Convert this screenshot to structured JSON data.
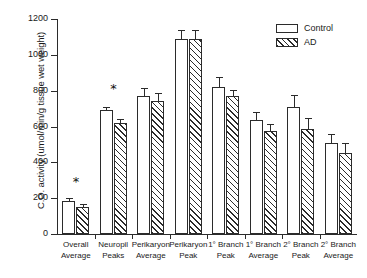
{
  "chart_data": {
    "type": "bar",
    "title": "",
    "xlabel": "",
    "ylabel": "C.O. activity (umol/min/g tissue wet weight)",
    "ylim": [
      0,
      1200
    ],
    "yticks": [
      0,
      200,
      400,
      600,
      800,
      1000,
      1200
    ],
    "grid": false,
    "legend_position": "top-right",
    "categories": [
      "Overall Average",
      "Neuropil Peaks",
      "Perikaryon Average",
      "Perikaryon Peak",
      "1° Branch Peak",
      "1° Branch Average",
      "2° Branch Peak",
      "2° Branch Average"
    ],
    "category_lines": [
      [
        "Overall",
        "Average"
      ],
      [
        "Neuropil",
        "Peaks"
      ],
      [
        "Perikaryon",
        "Average"
      ],
      [
        "Perikaryon",
        "Peak"
      ],
      [
        "1° Branch",
        "Peak"
      ],
      [
        "1° Branch",
        "Average"
      ],
      [
        "2° Branch",
        "Peak"
      ],
      [
        "2° Branch",
        "Average"
      ]
    ],
    "series": [
      {
        "name": "Control",
        "fill": "open",
        "values": [
          185,
          690,
          770,
          1090,
          820,
          635,
          710,
          510
        ],
        "errors": [
          10,
          15,
          40,
          45,
          50,
          40,
          60,
          40
        ]
      },
      {
        "name": "AD",
        "fill": "hatched",
        "values": [
          150,
          620,
          745,
          1090,
          770,
          575,
          585,
          450
        ],
        "errors": [
          10,
          15,
          35,
          45,
          30,
          35,
          55,
          50
        ]
      }
    ],
    "annotations": [
      {
        "text": "*",
        "category": "Overall Average",
        "value": 260
      },
      {
        "text": "*",
        "category": "Neuropil Peaks",
        "value": 780
      }
    ]
  },
  "legend": {
    "items": [
      {
        "label": "Control",
        "fill": "open"
      },
      {
        "label": "AD",
        "fill": "hatched"
      }
    ]
  }
}
